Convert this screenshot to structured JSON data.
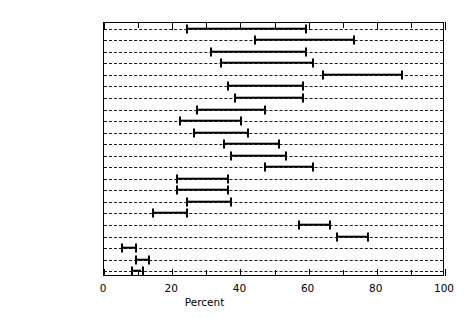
{
  "chart_data": {
    "type": "bar",
    "subtype": "horizontal-range",
    "title": "",
    "xlabel": "Percent",
    "ylabel": "",
    "xlim": [
      0,
      100
    ],
    "xticks": [
      0,
      20,
      40,
      60,
      80,
      100
    ],
    "xtick_labels": [
      "0",
      "20",
      "40",
      "60",
      "80",
      "100"
    ],
    "minor_tick_step": 10,
    "grid": "horizontal-dashed",
    "legend": "none",
    "categories": [
      "France",
      "Denmark",
      "Germany (FRG)",
      "Norway",
      "Sweden",
      "Netherlands",
      "Finland",
      "Austria",
      "Hong Kong",
      "Italy",
      "United Kingdom",
      "Australia",
      "New Zealand",
      "Spain",
      "Greece",
      "Israel",
      "Ireland",
      "Canada",
      "USA",
      "Mexico",
      "Hungary",
      "Poland"
    ],
    "ranges": [
      {
        "category": "France",
        "low": 24,
        "high": 59
      },
      {
        "category": "Denmark",
        "low": 44,
        "high": 73
      },
      {
        "category": "Germany (FRG)",
        "low": 31,
        "high": 59
      },
      {
        "category": "Norway",
        "low": 34,
        "high": 61
      },
      {
        "category": "Sweden",
        "low": 64,
        "high": 87
      },
      {
        "category": "Netherlands",
        "low": 36,
        "high": 58
      },
      {
        "category": "Finland",
        "low": 38,
        "high": 58
      },
      {
        "category": "Austria",
        "low": 27,
        "high": 47
      },
      {
        "category": "Hong Kong",
        "low": 22,
        "high": 40
      },
      {
        "category": "Italy",
        "low": 26,
        "high": 42
      },
      {
        "category": "United Kingdom",
        "low": 35,
        "high": 51
      },
      {
        "category": "Australia",
        "low": 37,
        "high": 53
      },
      {
        "category": "New Zealand",
        "low": 47,
        "high": 61
      },
      {
        "category": "Spain",
        "low": 21,
        "high": 36
      },
      {
        "category": "Greece",
        "low": 21,
        "high": 36
      },
      {
        "category": "Israel",
        "low": 24,
        "high": 37
      },
      {
        "category": "Ireland",
        "low": 14,
        "high": 24
      },
      {
        "category": "Canada",
        "low": 57,
        "high": 66
      },
      {
        "category": "USA",
        "low": 68,
        "high": 77
      },
      {
        "category": "Mexico",
        "low": 5,
        "high": 9
      },
      {
        "category": "Hungary",
        "low": 9,
        "high": 13
      },
      {
        "category": "Poland",
        "low": 8,
        "high": 11
      }
    ]
  }
}
